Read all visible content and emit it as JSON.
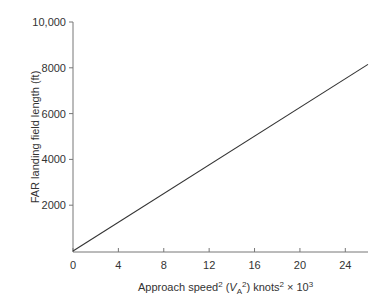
{
  "chart_data": {
    "type": "line",
    "title": "",
    "xlabel": "Approach speed² (V_A²) knots² × 10³",
    "ylabel": "FAR landing field length (ft)",
    "xlim": [
      0,
      26
    ],
    "ylim": [
      0,
      10000
    ],
    "x_ticks": [
      0,
      4,
      8,
      12,
      16,
      20,
      24
    ],
    "x_tick_labels": [
      "0",
      "4",
      "8",
      "12",
      "16",
      "20",
      "24"
    ],
    "y_ticks": [
      2000,
      4000,
      6000,
      8000,
      10000
    ],
    "y_tick_labels": [
      "2000",
      "4000",
      "6000",
      "8000",
      "10,000"
    ],
    "grid": false,
    "legend": null,
    "series": [
      {
        "name": "FAR landing field length",
        "x": [
          0,
          26
        ],
        "y": [
          0,
          8150
        ],
        "color": "#333333"
      }
    ]
  },
  "labels": {
    "x_prefix": "Approach speed",
    "x_sup1": "2",
    "x_paren_open": " (",
    "x_var": "V",
    "x_sub": "A",
    "x_sup2": "2",
    "x_paren_close": ") knots",
    "x_sup3": "2",
    "x_times": " × 10",
    "x_sup4": "3",
    "y_label": "FAR landing field length (ft)"
  }
}
